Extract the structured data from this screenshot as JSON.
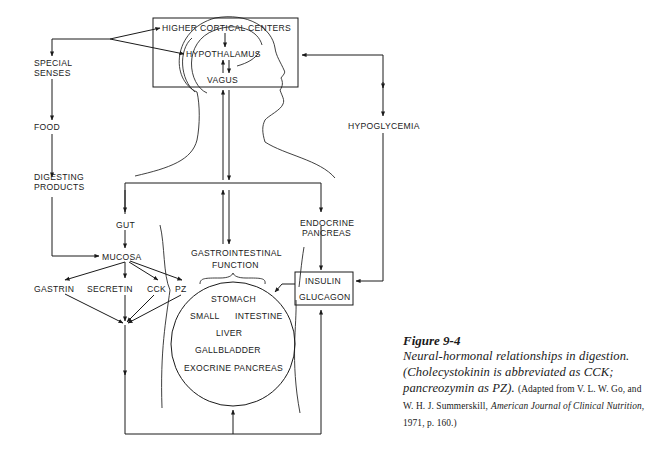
{
  "diagram": {
    "nodes": {
      "higher_cortical_centers": "HIGHER CORTICAL CENTERS",
      "hypothalamus": "HYPOTHALAMUS",
      "vagus": "VAGUS",
      "special_senses_1": "SPECIAL",
      "special_senses_2": "SENSES",
      "food": "FOOD",
      "digesting_products_1": "DIGESTING",
      "digesting_products_2": "PRODUCTS",
      "hypoglycemia": "HYPOGLYCEMIA",
      "gut": "GUT",
      "mucosa": "MUCOSA",
      "gastrin": "GASTRIN",
      "secretin": "SECRETIN",
      "cck": "CCK",
      "pz": "PZ",
      "gi_function_1": "GASTROINTESTINAL",
      "gi_function_2": "FUNCTION",
      "endocrine_pancreas_1": "ENDOCRINE",
      "endocrine_pancreas_2": "PANCREAS",
      "insulin": "INSULIN",
      "glucagon": "GLUCAGON",
      "stomach": "STOMACH",
      "small": "SMALL",
      "intestine": "INTESTINE",
      "liver": "LIVER",
      "gallbladder": "GALLBLADDER",
      "exocrine_pancreas": "EXOCRINE PANCREAS"
    }
  },
  "caption": {
    "title": "Figure 9-4",
    "body": "Neural-hormonal relationships in digestion. (Cholecystokinin is abbreviated as CCK; pancreozymin as PZ).",
    "source_prefix": "(Adapted from V. L. W. Go, and W. H. J. Summerskill,",
    "journal": "American Journal of Clinical Nutrition",
    "source_suffix": ", 1971, p. 160.)"
  }
}
